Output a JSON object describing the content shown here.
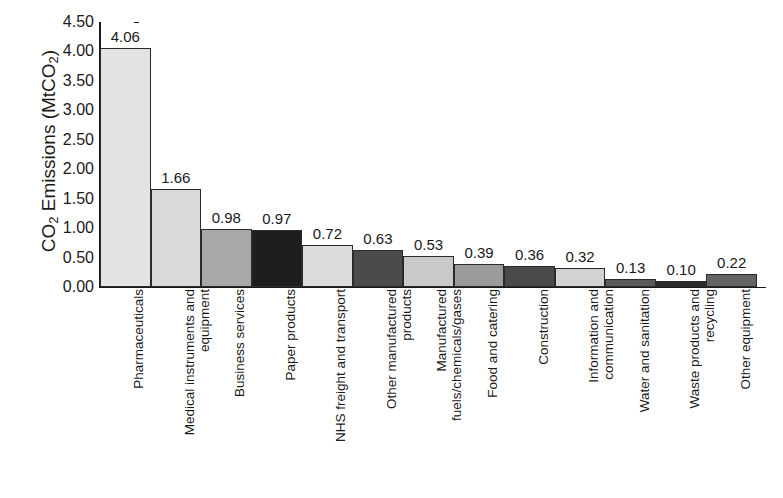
{
  "chart_data": {
    "type": "bar",
    "title": "",
    "xlabel": "",
    "ylabel": "CO2 Emissions (MtCO2)",
    "ylabel_parts": {
      "prefix": "CO",
      "sub1": "2",
      "middle": " Emissions (MtCO",
      "sub2": "2",
      "suffix": ")"
    },
    "ylim": [
      0.0,
      4.5
    ],
    "ytick_labels": [
      "4.50",
      "4.00",
      "3.50",
      "3.00",
      "2.50",
      "2.00",
      "1.50",
      "1.00",
      "0.50",
      "0.00"
    ],
    "ytick_values": [
      4.5,
      4.0,
      3.5,
      3.0,
      2.5,
      2.0,
      1.5,
      1.0,
      0.5,
      0.0
    ],
    "grid": false,
    "legend": "none",
    "categories": [
      "Pharmaceuticals",
      "Medical instruments and\nequipment",
      "Business services",
      "Paper products",
      "NHS freight and transport",
      "Other manufactured\nproducts",
      "Manufactured\nfuels/chemicals/gases",
      "Food and catering",
      "Construction",
      "Information and\ncommunication",
      "Water and sanitation",
      "Waste products and\nrecycling",
      "Other equipment"
    ],
    "values": [
      4.06,
      1.66,
      0.98,
      0.97,
      0.72,
      0.63,
      0.53,
      0.39,
      0.36,
      0.32,
      0.13,
      0.1,
      0.22
    ],
    "value_labels": [
      "4.06",
      "1.66",
      "0.98",
      "0.97",
      "0.72",
      "0.63",
      "0.53",
      "0.39",
      "0.36",
      "0.32",
      "0.13",
      "0.10",
      "0.22"
    ],
    "bar_colors": [
      "#e3e3e3",
      "#d9d9d9",
      "#a8a8a8",
      "#1e1e1e",
      "#dcdcdc",
      "#4b4b4b",
      "#c9c9c9",
      "#9b9b9b",
      "#4a4a4a",
      "#d2d2d2",
      "#5a5a5a",
      "#2a2a2a",
      "#636363"
    ]
  }
}
